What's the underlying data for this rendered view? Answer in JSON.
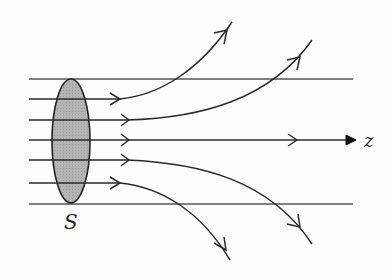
{
  "diagram": {
    "labels": {
      "surface": "S",
      "axis": "z"
    },
    "colors": {
      "background": "#fdfdfb",
      "line": "#2a2a2a",
      "surface_fill": "#b0b0b0",
      "guide_line": "#555555"
    },
    "elements": {
      "guide_lines": [
        {
          "name": "top-boundary",
          "y": 79
        },
        {
          "name": "bottom-boundary",
          "y": 204
        }
      ],
      "surface": {
        "cx": 71,
        "cy": 141,
        "rx": 19,
        "ry": 62
      },
      "field_lines": [
        {
          "name": "field-line-1",
          "start_y": 99,
          "end": [
            232,
            22
          ],
          "direction": "up"
        },
        {
          "name": "field-line-2",
          "start_y": 120,
          "end": [
            312,
            40
          ],
          "direction": "up"
        },
        {
          "name": "field-line-3",
          "start_y": 140,
          "end": [
            353,
            140
          ],
          "direction": "straight"
        },
        {
          "name": "field-line-4",
          "start_y": 160,
          "end": [
            312,
            244
          ],
          "direction": "down"
        },
        {
          "name": "field-line-5",
          "start_y": 183,
          "end": [
            230,
            260
          ],
          "direction": "down"
        }
      ]
    }
  }
}
